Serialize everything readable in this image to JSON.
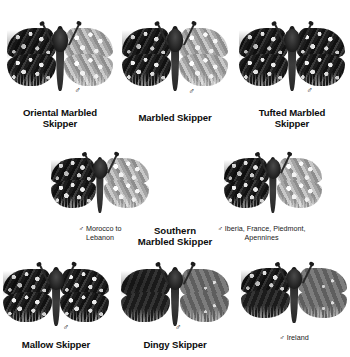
{
  "plate": {
    "background_color": "#ffffff",
    "text_color": "#111111",
    "male_symbol": "♂"
  },
  "rows": [
    {
      "row_id": "row-1",
      "specimens": [
        {
          "name": "Oriental Marbled\nSkipper",
          "sex": "♂",
          "locality": "",
          "wing_style": "marbled"
        },
        {
          "name": "Marbled Skipper",
          "sex": "♂",
          "locality": "",
          "wing_style": "marbled"
        },
        {
          "name": "Tufted Marbled\nSkipper",
          "sex": "♂",
          "locality": "",
          "wing_style": "marbled"
        }
      ]
    },
    {
      "row_id": "row-2",
      "group_name": "Southern\nMarbled Skipper",
      "specimens": [
        {
          "name": "",
          "sex": "♂",
          "locality": "Morocco to\nLebanon",
          "locality_line1": "Morocco to",
          "locality_line2": "Lebanon",
          "wing_style": "marbled"
        },
        {
          "name": "",
          "sex": "♂",
          "locality": "Iberia, France, Piedmont,\nApennines",
          "locality_line1": "Iberia, France, Piedmont,",
          "locality_line2": "Apennines",
          "wing_style": "marbled"
        }
      ]
    },
    {
      "row_id": "row-3",
      "specimens": [
        {
          "name": "Mallow Skipper",
          "sex": "♂",
          "locality": "",
          "wing_style": "marbled-dark"
        },
        {
          "name": "Dingy Skipper",
          "sex": "♂",
          "locality": "",
          "wing_style": "plain"
        },
        {
          "name": "",
          "sex": "♂",
          "locality": "Ireland",
          "wing_style": "plain"
        }
      ]
    }
  ],
  "labels": {
    "r1c1_name": "Oriental Marbled\nSkipper",
    "r1c2_name": "Marbled Skipper",
    "r1c3_name": "Tufted Marbled\nSkipper",
    "r1c1_sex": "♂",
    "r1c2_sex": "♂",
    "r1c3_sex": "♂",
    "r2c1_sexloc_l1": "♂ Morocco to",
    "r2c1_sexloc_l2": "Lebanon",
    "r2c2_sexloc_l1": "♂  Iberia, France, Piedmont,",
    "r2c2_sexloc_l2": "Apennines",
    "r2_group_name": "Southern\nMarbled Skipper",
    "r3c1_name": "Mallow Skipper",
    "r3c2_name": "Dingy Skipper",
    "r3c1_sex": "♂",
    "r3c2_sex": "♂",
    "r3c3_sexloc": "♂ Ireland"
  }
}
